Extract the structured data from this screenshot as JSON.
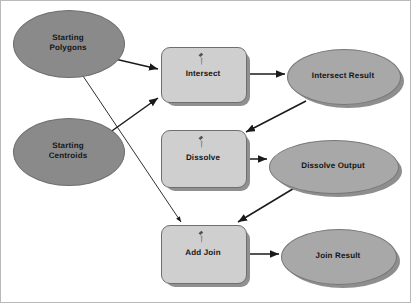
{
  "diagram": {
    "background_color": "#ffffff",
    "border_color": "#b9b9b9",
    "colors": {
      "input_fill": "#8a8a8a",
      "derived_fill": "#a8a8a8",
      "tool_fill": "#cfcfcf",
      "shadow": "#909090",
      "edge": "#1a1a1a",
      "label": "#151515"
    },
    "nodes": [
      {
        "id": "starting-polygons",
        "label": "Starting\nPolygons",
        "type": "input-data",
        "shape": "ellipse",
        "x": 12,
        "y": 9,
        "w": 110,
        "h": 66,
        "shadow": false
      },
      {
        "id": "starting-centroids",
        "label": "Starting\nCentroids",
        "type": "input-data",
        "shape": "ellipse",
        "x": 12,
        "y": 117,
        "w": 110,
        "h": 66,
        "shadow": false
      },
      {
        "id": "intersect",
        "label": "Intersect",
        "type": "tool",
        "shape": "rounded-rect",
        "x": 160,
        "y": 46,
        "w": 84,
        "h": 54,
        "shadow": true,
        "icon": "tool-hammer-icon"
      },
      {
        "id": "intersect-result",
        "label": "Intersect Result",
        "type": "derived-data",
        "shape": "ellipse",
        "x": 286,
        "y": 48,
        "w": 112,
        "h": 54,
        "shadow": true
      },
      {
        "id": "dissolve",
        "label": "Dissolve",
        "type": "tool",
        "shape": "rounded-rect",
        "x": 160,
        "y": 129,
        "w": 84,
        "h": 56,
        "shadow": true,
        "icon": "tool-hammer-icon"
      },
      {
        "id": "dissolve-output",
        "label": "Dissolve Output",
        "type": "derived-data",
        "shape": "ellipse",
        "x": 268,
        "y": 139,
        "w": 128,
        "h": 52,
        "shadow": true
      },
      {
        "id": "add-join",
        "label": "Add Join",
        "type": "tool",
        "shape": "rounded-rect",
        "x": 160,
        "y": 224,
        "w": 84,
        "h": 57,
        "shadow": true,
        "icon": "tool-hammer-icon"
      },
      {
        "id": "join-result",
        "label": "Join Result",
        "type": "derived-data",
        "shape": "ellipse",
        "x": 280,
        "y": 228,
        "w": 114,
        "h": 54,
        "shadow": true
      }
    ],
    "edges": [
      {
        "id": "e1",
        "from": "starting-polygons",
        "to": "intersect",
        "x1": 114,
        "y1": 58,
        "x2": 157,
        "y2": 68
      },
      {
        "id": "e2",
        "from": "starting-centroids",
        "to": "intersect",
        "x1": 108,
        "y1": 132,
        "x2": 157,
        "y2": 97
      },
      {
        "id": "e3",
        "from": "starting-polygons",
        "to": "add-join",
        "x1": 80,
        "y1": 72,
        "x2": 180,
        "y2": 221
      },
      {
        "id": "e4",
        "from": "intersect",
        "to": "intersect-result",
        "x1": 245,
        "y1": 73,
        "x2": 284,
        "y2": 73
      },
      {
        "id": "e5",
        "from": "intersect-result",
        "to": "dissolve",
        "x1": 305,
        "y1": 100,
        "x2": 245,
        "y2": 131
      },
      {
        "id": "e6",
        "from": "dissolve",
        "to": "dissolve-output",
        "x1": 245,
        "y1": 158,
        "x2": 266,
        "y2": 158
      },
      {
        "id": "e7",
        "from": "dissolve-output",
        "to": "add-join",
        "x1": 295,
        "y1": 186,
        "x2": 237,
        "y2": 221
      },
      {
        "id": "e8",
        "from": "add-join",
        "to": "join-result",
        "x1": 245,
        "y1": 253,
        "x2": 278,
        "y2": 253
      }
    ]
  }
}
